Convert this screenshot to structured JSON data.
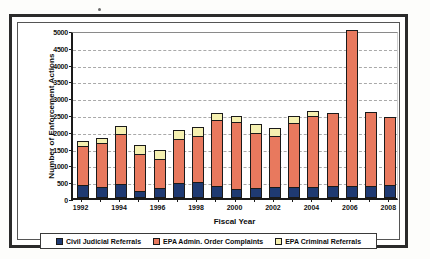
{
  "figure": {
    "speck_note": "stray-toner-dot"
  },
  "chart_data": {
    "type": "bar",
    "stacked": true,
    "title": "",
    "xlabel": "Fiscal Year",
    "ylabel": "Number of Enforcement Actions",
    "ylim": [
      0,
      5000
    ],
    "ytick_step": 500,
    "yticks": [
      "5000",
      "4500",
      "4000",
      "3500",
      "3000",
      "2500",
      "2000",
      "1500",
      "1000",
      "500",
      "0"
    ],
    "grid": true,
    "legend_position": "bottom",
    "categories": [
      "1992",
      "1993",
      "1994",
      "1995",
      "1996",
      "1997",
      "1998",
      "1999",
      "2000",
      "2001",
      "2002",
      "2003",
      "2004",
      "2005",
      "2006",
      "2007",
      "2008"
    ],
    "xtick_labels_shown": [
      "1992",
      "1994",
      "1996",
      "1998",
      "2000",
      "2002",
      "2004",
      "2006",
      "2008"
    ],
    "series": [
      {
        "name": "Civil Judicial Referrals",
        "color": "#1F3A72",
        "values": [
          375,
          340,
          430,
          215,
          310,
          450,
          470,
          355,
          280,
          290,
          315,
          330,
          340,
          350,
          360,
          345,
          375
        ]
      },
      {
        "name": "EPA Admin. Order Complaints",
        "color": "#E8795E",
        "values": [
          1180,
          1300,
          1475,
          1110,
          860,
          1300,
          1370,
          1960,
          1980,
          1655,
          1530,
          1890,
          2110,
          2190,
          4640,
          2220,
          2050
        ]
      },
      {
        "name": "EPA Criminal Referrals",
        "color": "#F5F0B0",
        "values": [
          130,
          150,
          235,
          265,
          260,
          270,
          260,
          230,
          185,
          260,
          235,
          225,
          150,
          0,
          0,
          0,
          0
        ]
      }
    ],
    "totals": [
      1685,
      1790,
      2140,
      1590,
      1430,
      2020,
      2100,
      2545,
      2445,
      2205,
      2080,
      2445,
      2600,
      2540,
      5000,
      2565,
      2425
    ]
  },
  "legend": {
    "items": [
      {
        "label": "Civil Judicial Referrals",
        "color": "#1F3A72"
      },
      {
        "label": "EPA Admin. Order Complaints",
        "color": "#E8795E"
      },
      {
        "label": "EPA Criminal Referrals",
        "color": "#F5F0B0"
      }
    ]
  }
}
